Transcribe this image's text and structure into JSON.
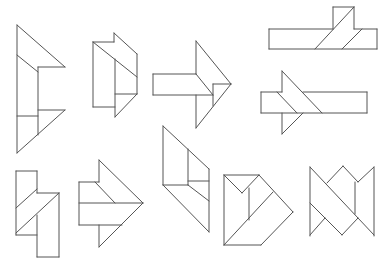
{
  "diagram": {
    "stroke_color": "#555555",
    "background": "#ffffff",
    "figure_count": 10,
    "figures": [
      {
        "id": 1,
        "name": "figure-1-tall-arrow",
        "segments": [
          [
            17,
            25,
            17,
            153
          ],
          [
            17,
            25,
            65,
            67
          ],
          [
            65,
            67,
            38,
            67
          ],
          [
            17,
            55,
            38,
            72
          ],
          [
            38,
            67,
            38,
            135
          ],
          [
            38,
            110,
            65,
            110
          ],
          [
            65,
            110,
            17,
            153
          ],
          [
            17,
            116,
            38,
            116
          ]
        ]
      },
      {
        "id": 2,
        "name": "figure-2-notched-block",
        "segments": [
          [
            93,
            42,
            114,
            42
          ],
          [
            114,
            42,
            114,
            33
          ],
          [
            114,
            33,
            137,
            54
          ],
          [
            137,
            54,
            137,
            94
          ],
          [
            137,
            94,
            115,
            117
          ],
          [
            93,
            42,
            93,
            107
          ],
          [
            93,
            107,
            115,
            107
          ],
          [
            115,
            59,
            115,
            117
          ],
          [
            93,
            42,
            137,
            77
          ],
          [
            115,
            94,
            137,
            94
          ]
        ]
      },
      {
        "id": 3,
        "name": "figure-3-arrow-right",
        "segments": [
          [
            196,
            41,
            231,
            84
          ],
          [
            231,
            84,
            196,
            128
          ],
          [
            196,
            41,
            196,
            74
          ],
          [
            153,
            74,
            196,
            74
          ],
          [
            153,
            74,
            153,
            95
          ],
          [
            153,
            95,
            213,
            95
          ],
          [
            196,
            74,
            213,
            95
          ],
          [
            196,
            95,
            196,
            128
          ],
          [
            213,
            84,
            231,
            84
          ],
          [
            213,
            84,
            213,
            106
          ]
        ]
      },
      {
        "id": 4,
        "name": "figure-4-long-bar-with-square",
        "segments": [
          [
            269,
            29,
            333,
            29
          ],
          [
            269,
            29,
            269,
            49
          ],
          [
            269,
            49,
            377,
            49
          ],
          [
            377,
            49,
            377,
            29
          ],
          [
            354,
            29,
            377,
            29
          ],
          [
            333,
            7,
            354,
            7
          ],
          [
            333,
            7,
            333,
            29
          ],
          [
            354,
            7,
            354,
            29
          ],
          [
            354,
            7,
            315,
            49
          ],
          [
            362,
            29,
            342,
            49
          ]
        ]
      },
      {
        "id": 5,
        "name": "figure-5-bar-with-arrowhead",
        "segments": [
          [
            261,
            92,
            282,
            92
          ],
          [
            261,
            92,
            261,
            113
          ],
          [
            261,
            113,
            367,
            113
          ],
          [
            367,
            113,
            367,
            92
          ],
          [
            303,
            92,
            367,
            92
          ],
          [
            282,
            71,
            282,
            92
          ],
          [
            282,
            71,
            322,
            113
          ],
          [
            277,
            92,
            297,
            113
          ],
          [
            282,
            113,
            282,
            134
          ],
          [
            282,
            134,
            303,
            113
          ]
        ]
      },
      {
        "id": 6,
        "name": "figure-6-stepped-column",
        "segments": [
          [
            16,
            171,
            37,
            171
          ],
          [
            16,
            171,
            16,
            235
          ],
          [
            37,
            171,
            37,
            193
          ],
          [
            37,
            193,
            59,
            193
          ],
          [
            59,
            193,
            59,
            257
          ],
          [
            37,
            257,
            59,
            257
          ],
          [
            37,
            215,
            37,
            257
          ],
          [
            16,
            235,
            37,
            235
          ],
          [
            16,
            208,
            37,
            189
          ],
          [
            16,
            233,
            59,
            193
          ]
        ]
      },
      {
        "id": 7,
        "name": "figure-7-arrow-right-split",
        "segments": [
          [
            99,
            160,
            99,
            182
          ],
          [
            99,
            160,
            143,
            203
          ],
          [
            79,
            182,
            99,
            182
          ],
          [
            79,
            182,
            79,
            225
          ],
          [
            79,
            203,
            143,
            203
          ],
          [
            95,
            182,
            115,
            203
          ],
          [
            79,
            225,
            122,
            225
          ],
          [
            143,
            203,
            99,
            247
          ],
          [
            99,
            225,
            99,
            247
          ]
        ]
      },
      {
        "id": 8,
        "name": "figure-8-slanted-block",
        "segments": [
          [
            163,
            126,
            163,
            185
          ],
          [
            163,
            126,
            209,
            169
          ],
          [
            209,
            169,
            209,
            232
          ],
          [
            188,
            149,
            188,
            185
          ],
          [
            188,
            181,
            209,
            181
          ],
          [
            163,
            185,
            188,
            185
          ],
          [
            163,
            185,
            209,
            232
          ],
          [
            188,
            185,
            209,
            201
          ]
        ]
      },
      {
        "id": 9,
        "name": "figure-9-notched-pentagon",
        "segments": [
          [
            224,
            175,
            259,
            175
          ],
          [
            224,
            175,
            224,
            245
          ],
          [
            224,
            175,
            242,
            193
          ],
          [
            242,
            193,
            259,
            175
          ],
          [
            249,
            188,
            249,
            220
          ],
          [
            259,
            175,
            293,
            212
          ],
          [
            293,
            212,
            261,
            245
          ],
          [
            224,
            245,
            261,
            245
          ],
          [
            224,
            245,
            273,
            192
          ]
        ]
      },
      {
        "id": 10,
        "name": "figure-10-zigzag-block",
        "segments": [
          [
            310,
            167,
            310,
            236
          ],
          [
            374,
            167,
            374,
            236
          ],
          [
            310,
            167,
            358,
            218
          ],
          [
            327,
            183,
            343,
            166
          ],
          [
            343,
            166,
            358,
            182
          ],
          [
            358,
            182,
            374,
            167
          ],
          [
            355,
            182,
            355,
            214
          ],
          [
            310,
            203,
            342,
            235
          ],
          [
            342,
            235,
            358,
            218
          ],
          [
            358,
            218,
            374,
            235
          ],
          [
            310,
            235,
            325,
            218
          ]
        ]
      }
    ]
  }
}
